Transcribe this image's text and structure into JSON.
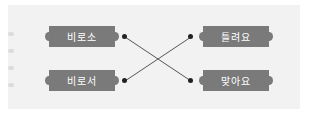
{
  "left_items": [
    {
      "label": "비로소"
    },
    {
      "label": "비로서"
    }
  ],
  "right_items": [
    {
      "label": "틀려요"
    },
    {
      "label": "맞아요"
    }
  ],
  "connections": [
    {
      "from": "비로소",
      "to": "맞아요"
    },
    {
      "from": "비로서",
      "to": "틀려요"
    }
  ],
  "colors": {
    "box": "#7a7a7a",
    "panel": "#f2f2f2",
    "line": "#555555"
  }
}
